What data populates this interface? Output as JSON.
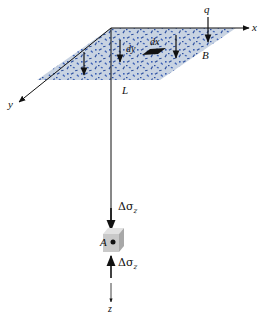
{
  "figure": {
    "colors": {
      "plate_fill": "#c8d3e2",
      "speckle": "#2c4fa0",
      "line": "#111111",
      "cube_front": "#c9c9c9",
      "cube_top": "#e2e2e2",
      "cube_side": "#a8a8a8"
    }
  },
  "axes": {
    "x_label": "x",
    "y_label": "y",
    "z_label": "z"
  },
  "plate": {
    "load_label": "q",
    "width_label": "B",
    "length_label": "L",
    "element_dx_label": "dx",
    "element_dy_label": "dy"
  },
  "point": {
    "label": "A"
  },
  "stress": {
    "top_label_base": "Δσ",
    "top_label_sub": "z",
    "bottom_label_base": "Δσ",
    "bottom_label_sub": "z"
  }
}
